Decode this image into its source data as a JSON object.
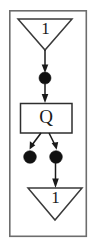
{
  "diagram": {
    "type": "petri-net-fragment",
    "background_color": "#ffffff",
    "ink_color": "#1a1a1a",
    "frame_color": "#6d6d6d",
    "frame": {
      "name": "outer-frame",
      "x": 9,
      "y": 10,
      "width": 78,
      "height": 227
    },
    "nodes": [
      {
        "id": "place-top",
        "kind": "triangle-place",
        "label": "1",
        "orientation": "point-down",
        "cx": 45,
        "cy": 34,
        "half_width": 27,
        "height": 31,
        "top_y": 19
      },
      {
        "id": "token-upper",
        "kind": "token-dot",
        "label": "",
        "cx": 45,
        "cy": 78,
        "r": 6
      },
      {
        "id": "transition-q",
        "kind": "rect-transition",
        "label": "Q",
        "x": 20,
        "y": 103,
        "width": 52,
        "height": 30
      },
      {
        "id": "token-left",
        "kind": "token-dot",
        "label": "",
        "cx": 30,
        "cy": 157,
        "r": 6
      },
      {
        "id": "token-right",
        "kind": "token-dot",
        "label": "",
        "cx": 56,
        "cy": 157,
        "r": 6
      },
      {
        "id": "place-bottom",
        "kind": "triangle-place",
        "label": "1",
        "orientation": "point-down",
        "cx": 55,
        "cy": 203,
        "half_width": 27,
        "height": 32,
        "top_y": 188
      }
    ],
    "arcs": [
      {
        "id": "arc-top-to-token",
        "from": "place-top",
        "to": "token-upper",
        "style": "straight-arrow"
      },
      {
        "id": "arc-token-to-q",
        "from": "token-upper",
        "to": "transition-q",
        "style": "straight-arrow"
      },
      {
        "id": "arc-q-to-token-left",
        "from": "transition-q",
        "to": "token-left",
        "style": "diagonal-arrow"
      },
      {
        "id": "arc-q-to-token-right",
        "from": "transition-q",
        "to": "token-right",
        "style": "diagonal-arrow"
      },
      {
        "id": "arc-token-right-to-bottom",
        "from": "token-right",
        "to": "place-bottom",
        "style": "straight-arrow"
      }
    ]
  }
}
